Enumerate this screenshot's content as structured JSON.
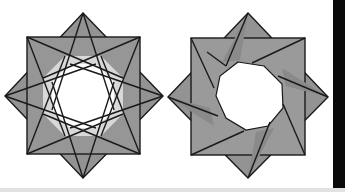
{
  "figures": [
    {
      "id": "left-star",
      "description": "Eight-pointed star: square overlaid with rotated square, interwoven strips around a white octagon with light gray triangular gaps",
      "center": [
        83,
        96
      ],
      "square": {
        "x": 27,
        "y": 37,
        "w": 113,
        "h": 117
      },
      "diamond": [
        [
          83,
          13
        ],
        [
          163,
          96
        ],
        [
          83,
          178
        ],
        [
          5,
          96
        ]
      ]
    },
    {
      "id": "right-star",
      "description": "Eight-pointed star: square overlaid with rotated square, pinwheel strips around a white octagon",
      "center": [
        248,
        96
      ],
      "square": {
        "x": 191,
        "y": 38,
        "w": 114,
        "h": 117
      },
      "diamond": [
        [
          248,
          13
        ],
        [
          328,
          97
        ],
        [
          248,
          178
        ],
        [
          168,
          97
        ]
      ]
    }
  ],
  "colors": {
    "fill_dark": "#8e8e8e",
    "fill_mid": "#9c9c9c",
    "fill_light": "#d9d9d9",
    "stroke": "#1a1a1a",
    "background": "#ffffff",
    "bar": "#0a0a0a",
    "strip": "#e2e2e2"
  }
}
